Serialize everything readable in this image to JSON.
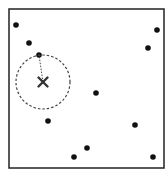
{
  "diagram": {
    "type": "nearest-neighbor-radius-query",
    "frame": {
      "x": 9,
      "y": 9,
      "width": 155,
      "height": 159,
      "stroke": "#222222"
    },
    "points": [
      {
        "x": 16,
        "y": 25
      },
      {
        "x": 29,
        "y": 43
      },
      {
        "x": 39,
        "y": 55
      },
      {
        "x": 157,
        "y": 30
      },
      {
        "x": 148,
        "y": 48
      },
      {
        "x": 96,
        "y": 93
      },
      {
        "x": 48,
        "y": 121
      },
      {
        "x": 135,
        "y": 125
      },
      {
        "x": 87,
        "y": 148
      },
      {
        "x": 74,
        "y": 157
      },
      {
        "x": 153,
        "y": 157
      }
    ],
    "query": {
      "x": 43,
      "y": 82,
      "marker": "x-mark",
      "radius": 27,
      "nearest_index": 2
    },
    "colors": {
      "point": "#111111",
      "query": "#333333",
      "circle": "#444444"
    }
  }
}
